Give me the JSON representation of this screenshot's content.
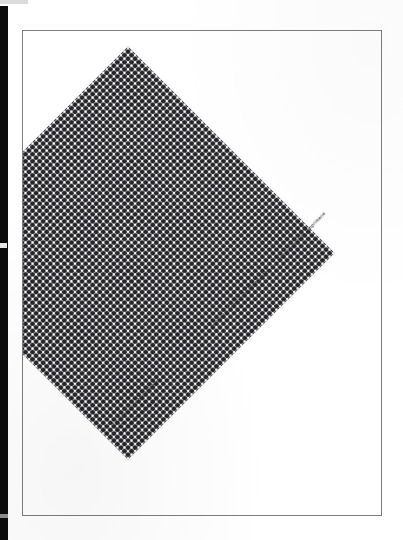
{
  "document": {
    "kind": "scanned-journal-cover",
    "publication_title": "Typographische Monatsblätter",
    "issue_label": "Nr 5",
    "date_and_volume": "Mai 1963 82. Jahrgang",
    "subtitle_german": "Schweizer Graphische Mitteilungen",
    "subtitle_french": "Revue suisse de l'Imprimerie",
    "subtitle_separator": "·"
  },
  "colors": {
    "paper": "#ffffff",
    "ink": "#1d1d1d",
    "pattern_field": "#26262a",
    "pattern_dot": "#ffffff",
    "page_rule": "#7d7d7d",
    "scan_edge": "#0c0c0c"
  }
}
